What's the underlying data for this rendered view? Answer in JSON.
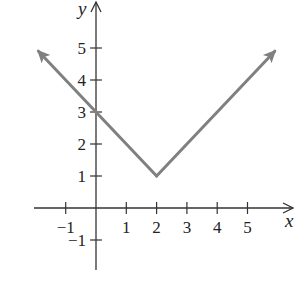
{
  "chart_data": {
    "type": "line",
    "title": "",
    "function": "y = |x - 2| + 1",
    "xlabel": "x",
    "ylabel": "y",
    "xlim": [
      -2,
      6.3
    ],
    "ylim": [
      -2.3,
      6.2
    ],
    "grid": false,
    "legend": null,
    "x_ticks": [
      -1,
      1,
      2,
      3,
      4,
      5
    ],
    "y_ticks": [
      -1,
      1,
      2,
      3,
      4,
      5
    ],
    "x_tick_labels": [
      "−1",
      "1",
      "2",
      "3",
      "4",
      "5"
    ],
    "y_tick_labels": [
      "−1",
      "1",
      "2",
      "3",
      "4",
      "5"
    ],
    "series": [
      {
        "name": "y = |x - 2| + 1",
        "color": "#808080",
        "x": [
          -1.9,
          0,
          2,
          4,
          5.9
        ],
        "y": [
          4.9,
          3,
          1,
          3,
          4.9
        ],
        "arrows_at_ends": true
      }
    ],
    "annotations": [
      {
        "label": "vertex",
        "x": 2,
        "y": 1
      },
      {
        "label": "y-intercept",
        "x": 0,
        "y": 3
      }
    ]
  },
  "colors": {
    "axis": "#333333",
    "curve": "#808080",
    "text": "#222222"
  }
}
